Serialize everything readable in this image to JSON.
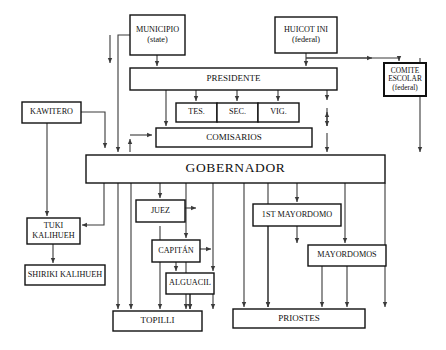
{
  "diagram": {
    "colors": {
      "box_stroke": "#111111",
      "line": "#3a3a3a",
      "background": "#ffffff",
      "text": "#101010"
    },
    "nodes": [
      {
        "id": "municipio",
        "label": "MUNICIPIO",
        "sublabel": "(state)",
        "x": 130,
        "y": 15,
        "w": 55,
        "h": 40,
        "size": "t8",
        "weight": "normal"
      },
      {
        "id": "huicot",
        "label": "HUICOT INI",
        "sublabel": "(federal)",
        "x": 275,
        "y": 17,
        "w": 62,
        "h": 36,
        "size": "t8",
        "weight": "normal"
      },
      {
        "id": "comite",
        "label": "COMITE",
        "sublabel": "ESCOLAR",
        "sublabel2": "(federal)",
        "x": 384,
        "y": 63,
        "w": 42,
        "h": 33,
        "size": "t7",
        "weight": "bold"
      },
      {
        "id": "presidente",
        "label": "PRESIDENTE",
        "x": 130,
        "y": 68,
        "w": 207,
        "h": 22,
        "size": "t9",
        "weight": "normal"
      },
      {
        "id": "tes",
        "label": "TES.",
        "x": 176,
        "y": 103,
        "w": 41,
        "h": 19,
        "size": "t8",
        "weight": "normal"
      },
      {
        "id": "sec",
        "label": "SEC.",
        "x": 217,
        "y": 103,
        "w": 41,
        "h": 19,
        "size": "t8",
        "weight": "normal"
      },
      {
        "id": "vig",
        "label": "VIG.",
        "x": 258,
        "y": 103,
        "w": 41,
        "h": 19,
        "size": "t8",
        "weight": "normal"
      },
      {
        "id": "comisarios",
        "label": "COMISARIOS",
        "x": 156,
        "y": 128,
        "w": 156,
        "h": 19,
        "size": "t9",
        "weight": "normal"
      },
      {
        "id": "gobernador",
        "label": "GOBERNADOR",
        "x": 86,
        "y": 155,
        "w": 299,
        "h": 28,
        "size": "t13",
        "weight": "normal"
      },
      {
        "id": "kawitero",
        "label": "KAWITERO",
        "x": 22,
        "y": 102,
        "w": 59,
        "h": 21,
        "size": "t8",
        "weight": "normal"
      },
      {
        "id": "tuki",
        "label": "TUKI",
        "sublabel": "KALIHUEH",
        "x": 27,
        "y": 218,
        "w": 53,
        "h": 26,
        "size": "t8",
        "weight": "normal"
      },
      {
        "id": "shiriki",
        "label": "SHIRIKI KALIHUEH",
        "x": 25,
        "y": 265,
        "w": 80,
        "h": 20,
        "size": "t8",
        "weight": "normal"
      },
      {
        "id": "juez",
        "label": "JUEZ",
        "x": 136,
        "y": 200,
        "w": 49,
        "h": 22,
        "size": "t8",
        "weight": "normal"
      },
      {
        "id": "capitan",
        "label": "CAPITÁN",
        "x": 152,
        "y": 240,
        "w": 48,
        "h": 22,
        "size": "t8",
        "weight": "normal"
      },
      {
        "id": "alguacil",
        "label": "ALGUACIL",
        "x": 166,
        "y": 273,
        "w": 48,
        "h": 21,
        "size": "t8",
        "weight": "normal"
      },
      {
        "id": "topilli",
        "label": "TOPILLI",
        "x": 113,
        "y": 311,
        "w": 89,
        "h": 20,
        "size": "t9",
        "weight": "normal"
      },
      {
        "id": "mayordomo1",
        "label": "1ST MAYORDOMO",
        "x": 253,
        "y": 204,
        "w": 88,
        "h": 22,
        "size": "t8",
        "weight": "normal"
      },
      {
        "id": "mayordomos",
        "label": "MAYORDOMOS",
        "x": 308,
        "y": 245,
        "w": 78,
        "h": 21,
        "size": "t8",
        "weight": "normal"
      },
      {
        "id": "priostes",
        "label": "PRIOSTES",
        "x": 233,
        "y": 309,
        "w": 132,
        "h": 19,
        "size": "t9",
        "weight": "normal"
      }
    ],
    "connector_count": 38
  }
}
